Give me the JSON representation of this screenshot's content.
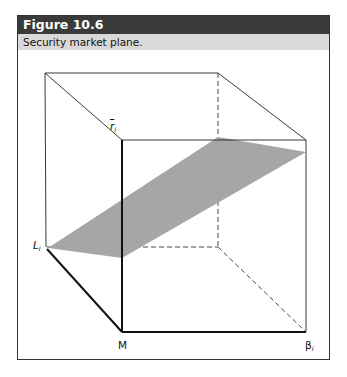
{
  "figure": {
    "number_label": "Figure 10.6",
    "caption": "Security market plane."
  },
  "axes": {
    "vertical": {
      "symbol": "r",
      "subscript": "i",
      "overbar": true
    },
    "left": {
      "symbol": "L",
      "subscript": "i"
    },
    "origin": {
      "symbol": "M"
    },
    "right": {
      "symbol": "β",
      "subscript": "i"
    }
  },
  "colors": {
    "header_bg": "#3a3a3a",
    "caption_bg": "#d9d9d9",
    "plane_fill": "#a6a6a6",
    "line": "#111111"
  }
}
